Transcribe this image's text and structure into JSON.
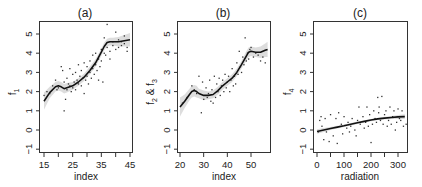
{
  "chart_data": [
    {
      "type": "scatter",
      "title": "(a)",
      "xlabel": "index",
      "ylabel": "f1",
      "xlim": [
        13.5,
        46
      ],
      "ylim": [
        -1.2,
        5.8
      ],
      "xticks": [
        15,
        25,
        35,
        45
      ],
      "xminor_ticks": [
        15,
        20,
        25,
        30,
        35,
        40,
        45
      ],
      "yticks": [
        -1,
        0,
        1,
        2,
        3,
        4,
        5
      ],
      "grid": false,
      "legend": null,
      "fit_curve": {
        "x": [
          15,
          17,
          19,
          20,
          21,
          22,
          23,
          25,
          27,
          29,
          31,
          33,
          35,
          36,
          37,
          38,
          39,
          41,
          43,
          45
        ],
        "y": [
          1.5,
          1.95,
          2.25,
          2.3,
          2.25,
          2.15,
          2.2,
          2.3,
          2.5,
          2.75,
          3.1,
          3.5,
          4.05,
          4.35,
          4.55,
          4.6,
          4.6,
          4.6,
          4.65,
          4.7
        ]
      },
      "band_halfwidth": [
        0.45,
        0.3,
        0.25,
        0.25,
        0.25,
        0.25,
        0.25,
        0.2,
        0.2,
        0.2,
        0.2,
        0.2,
        0.2,
        0.2,
        0.2,
        0.2,
        0.2,
        0.25,
        0.3,
        0.35
      ],
      "points": {
        "x": [
          15,
          16,
          17,
          18,
          19,
          19.5,
          20,
          21,
          21.5,
          22,
          22,
          22.5,
          23,
          23,
          23.5,
          24,
          24,
          24.5,
          25,
          25,
          25.5,
          26,
          26,
          26.5,
          27,
          27,
          27.5,
          28,
          28,
          28.5,
          29,
          29,
          29.5,
          30,
          30,
          30.5,
          31,
          31,
          31.5,
          32,
          32,
          32.5,
          33,
          33,
          33.5,
          34,
          34,
          34.5,
          35,
          35,
          35.5,
          36,
          36,
          36.5,
          37,
          37,
          38,
          38,
          39,
          39,
          40,
          40,
          41,
          41,
          42,
          42,
          43,
          43,
          44,
          44
        ],
        "y": [
          1.8,
          2.0,
          1.9,
          2.3,
          2.6,
          2.1,
          2.2,
          3.3,
          3.1,
          1.0,
          2.5,
          1.6,
          2.7,
          2.1,
          2.4,
          3.2,
          2.3,
          2.0,
          2.9,
          2.2,
          2.5,
          3.0,
          2.1,
          2.6,
          3.4,
          2.4,
          2.8,
          3.1,
          2.3,
          2.7,
          3.5,
          1.9,
          2.6,
          3.3,
          2.8,
          2.4,
          3.6,
          3.0,
          2.7,
          3.9,
          3.2,
          2.9,
          4.0,
          3.4,
          3.1,
          3.7,
          2.6,
          3.3,
          4.2,
          3.6,
          2.5,
          4.8,
          4.0,
          3.9,
          5.5,
          4.3,
          4.1,
          3.7,
          4.6,
          4.4,
          5.1,
          4.2,
          4.7,
          4.3,
          4.6,
          4.4,
          4.9,
          4.5,
          4.3,
          4.1,
          4.8,
          4.6
        ]
      }
    },
    {
      "type": "scatter",
      "title": "(b)",
      "xlabel": "index",
      "ylabel": "f2 & f3",
      "xlim": [
        18.5,
        57.5
      ],
      "ylim": [
        -1.2,
        5.8
      ],
      "xticks": [
        20,
        30,
        40,
        50
      ],
      "xminor_ticks": [
        20,
        30,
        40,
        50
      ],
      "yticks": [
        -1,
        0,
        1,
        2,
        3,
        4,
        5
      ],
      "grid": false,
      "legend": null,
      "fit_curve": {
        "x": [
          20,
          22,
          24,
          25,
          26,
          27,
          28,
          30,
          32,
          34,
          36,
          38,
          40,
          42,
          44,
          46,
          48,
          49,
          50,
          52,
          54,
          56,
          57
        ],
        "y": [
          1.2,
          1.5,
          1.85,
          2.0,
          2.05,
          2.0,
          1.9,
          1.8,
          1.8,
          1.85,
          2.05,
          2.3,
          2.5,
          2.7,
          3.0,
          3.4,
          3.85,
          4.05,
          4.1,
          4.05,
          4.05,
          4.15,
          4.2
        ]
      },
      "band_halfwidth": [
        0.5,
        0.35,
        0.3,
        0.3,
        0.3,
        0.3,
        0.25,
        0.25,
        0.2,
        0.2,
        0.2,
        0.2,
        0.2,
        0.2,
        0.2,
        0.2,
        0.25,
        0.25,
        0.25,
        0.25,
        0.3,
        0.35,
        0.4
      ],
      "points": {
        "x": [
          21,
          23,
          25,
          26,
          27,
          28,
          29,
          29.5,
          30,
          31,
          31.5,
          32,
          32.5,
          33,
          33.5,
          34,
          34.5,
          35,
          35.5,
          36,
          36.5,
          37,
          37.5,
          38,
          38.5,
          39,
          39.5,
          40,
          40.5,
          41,
          41.5,
          42,
          42.5,
          43,
          43.5,
          44,
          44.5,
          45,
          45.5,
          46,
          46.5,
          47,
          47.5,
          48,
          48.5,
          49,
          49.5,
          50,
          51,
          52,
          53,
          54,
          55,
          56
        ],
        "y": [
          1.4,
          1.7,
          2.3,
          2.1,
          1.9,
          2.8,
          0.9,
          2.5,
          1.6,
          2.2,
          1.7,
          1.9,
          2.6,
          1.5,
          2.1,
          1.4,
          2.8,
          1.7,
          2.4,
          2.0,
          2.7,
          1.8,
          2.3,
          2.6,
          2.0,
          2.9,
          2.2,
          2.5,
          2.8,
          2.0,
          2.6,
          3.2,
          2.3,
          2.8,
          2.4,
          3.5,
          2.9,
          4.1,
          3.3,
          3.0,
          3.8,
          3.4,
          4.8,
          3.6,
          4.0,
          3.7,
          4.2,
          4.3,
          3.8,
          4.0,
          3.9,
          3.6,
          3.8,
          3.5
        ]
      }
    },
    {
      "type": "scatter",
      "title": "(c)",
      "xlabel": "radiation",
      "ylabel": "f4",
      "xlim": [
        -15,
        335
      ],
      "ylim": [
        -1.2,
        5.8
      ],
      "xticks": [
        0,
        100,
        200,
        300
      ],
      "xminor_ticks": [
        0,
        50,
        100,
        150,
        200,
        250,
        300
      ],
      "yticks": [
        -1,
        0,
        1,
        2,
        3,
        4,
        5
      ],
      "grid": false,
      "legend": null,
      "fit_curve": {
        "x": [
          0,
          25,
          50,
          75,
          100,
          125,
          150,
          175,
          200,
          225,
          250,
          275,
          300,
          325
        ],
        "y": [
          -0.08,
          0.0,
          0.08,
          0.15,
          0.22,
          0.3,
          0.38,
          0.45,
          0.52,
          0.58,
          0.62,
          0.65,
          0.68,
          0.7
        ]
      },
      "band_halfwidth": [
        0.12,
        0.1,
        0.08,
        0.07,
        0.06,
        0.06,
        0.06,
        0.06,
        0.06,
        0.06,
        0.07,
        0.08,
        0.1,
        0.12
      ],
      "points": {
        "x": [
          5,
          10,
          15,
          18,
          25,
          30,
          35,
          45,
          50,
          60,
          70,
          75,
          80,
          90,
          95,
          100,
          110,
          115,
          120,
          125,
          130,
          140,
          145,
          150,
          155,
          160,
          170,
          175,
          180,
          185,
          190,
          195,
          200,
          205,
          210,
          215,
          220,
          225,
          228,
          230,
          235,
          240,
          245,
          250,
          255,
          260,
          265,
          270,
          275,
          280,
          285,
          290,
          295,
          300,
          305,
          310,
          315,
          320,
          330
        ],
        "y": [
          -0.1,
          0.5,
          0.7,
          0.2,
          -0.5,
          0.6,
          -0.1,
          -0.6,
          0.8,
          -0.3,
          0.6,
          -0.7,
          0.9,
          0.3,
          -0.2,
          0.7,
          0.1,
          0.4,
          -0.1,
          0.2,
          0.6,
          0.0,
          -0.3,
          0.5,
          1.2,
          0.3,
          0.7,
          0.1,
          0.4,
          1.2,
          0.2,
          0.8,
          -0.65,
          0.3,
          1.0,
          0.6,
          0.4,
          1.7,
          0.9,
          1.2,
          0.5,
          1.75,
          0.3,
          0.8,
          1.0,
          0.2,
          0.5,
          1.2,
          0.3,
          0.7,
          1.0,
          0.0,
          0.4,
          1.1,
          0.6,
          0.5,
          1.0,
          0.2,
          0.3
        ]
      }
    }
  ],
  "figure": {
    "panels": [
      {
        "title": "(a)",
        "xlabel": "index",
        "ylabel": "f",
        "ylabel_sub": "1",
        "xtick_labels": [
          "15",
          "25",
          "35",
          "45"
        ],
        "ytick_labels": [
          "-1",
          "0",
          "1",
          "2",
          "3",
          "4",
          "5"
        ]
      },
      {
        "title": "(b)",
        "xlabel": "index",
        "ylabel": "f",
        "ylabel_sub": "2",
        "ylabel_mid": " & f",
        "ylabel_sub2": "3",
        "xtick_labels": [
          "20",
          "30",
          "40",
          "50"
        ],
        "ytick_labels": [
          "-1",
          "0",
          "1",
          "2",
          "3",
          "4",
          "5"
        ]
      },
      {
        "title": "(c)",
        "xlabel": "radiation",
        "ylabel": "f",
        "ylabel_sub": "4",
        "xtick_labels": [
          "0",
          "100",
          "200",
          "300"
        ],
        "ytick_labels": [
          "-1",
          "0",
          "1",
          "2",
          "3",
          "4",
          "5"
        ]
      }
    ],
    "colors": {
      "curve": "#111111",
      "band": "#d9d9d9",
      "points": "#333333",
      "axis": "#333333"
    }
  }
}
